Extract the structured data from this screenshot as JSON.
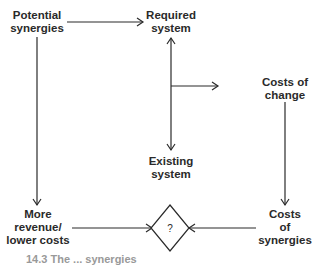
{
  "diagram": {
    "nodes": {
      "potential_synergies": "Potential\nsynergies",
      "required_system": "Required\nsystem",
      "existing_system": "Existing\nsystem",
      "costs_of_change": "Costs of\nchange",
      "more_revenue": "More\nrevenue/\nlower costs",
      "costs_of_synergies": "Costs\nof\nsynergies",
      "decision": "?"
    },
    "edges": [
      {
        "from": "potential_synergies",
        "to": "required_system"
      },
      {
        "from": "potential_synergies",
        "to": "more_revenue"
      },
      {
        "from": "existing_system",
        "to": "required_system",
        "bidirectional": true
      },
      {
        "from": "required_system",
        "to": "existing_system",
        "bidirectional": true
      },
      {
        "from": "required_system_existing_system_link",
        "to": "costs_of_change"
      },
      {
        "from": "costs_of_change",
        "to": "costs_of_synergies"
      },
      {
        "from": "more_revenue",
        "to": "decision"
      },
      {
        "from": "costs_of_synergies",
        "to": "decision"
      }
    ],
    "caption": "14.3 The ... synergies"
  },
  "colors": {
    "line": "#2a2a2a",
    "text": "#2a2a2a",
    "background": "#ffffff"
  }
}
